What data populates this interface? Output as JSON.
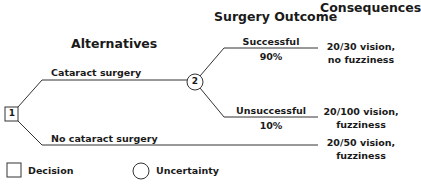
{
  "headings": {
    "alternatives": "Alternatives",
    "surgery_outcome": "Surgery Outcome",
    "consequences": "Consequences"
  },
  "nodes": {
    "decision": {
      "id": "1",
      "shape": "square"
    },
    "uncertainty": {
      "id": "2",
      "shape": "circle"
    }
  },
  "branches": {
    "cataract_surgery": "Cataract surgery",
    "no_cataract_surgery": "No cataract surgery",
    "successful": {
      "label": "Successful",
      "probability": "90%"
    },
    "unsuccessful": {
      "label": "Unsuccessful",
      "probability": "10%"
    }
  },
  "consequences": {
    "successful": {
      "line1": "20/30 vision,",
      "line2": "no fuzziness"
    },
    "unsuccessful": {
      "line1": "20/100 vision,",
      "line2": "fuzziness"
    },
    "no_surgery": {
      "line1": "20/50 vision,",
      "line2": "fuzziness"
    }
  },
  "legend": {
    "decision": "Decision",
    "uncertainty": "Uncertainty"
  }
}
